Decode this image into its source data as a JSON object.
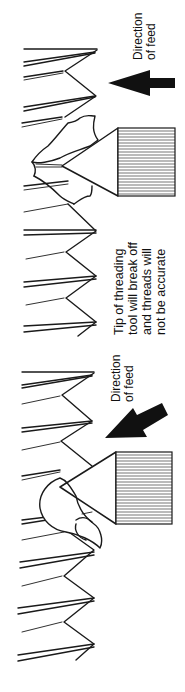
{
  "figure": {
    "orientation": "rotated-90-ccw",
    "panels": [
      {
        "id": "top",
        "description": "Incorrect feed: tool fed straight in",
        "feed_label": [
          "Direction",
          "of feed"
        ],
        "annotation": [
          "Tip of threading",
          "tool will break off",
          "and threads will",
          "not be accurate"
        ],
        "arrow_direction": "straight"
      },
      {
        "id": "bottom",
        "description": "Correct feed: tool fed at an angle, chip curls off",
        "feed_label": [
          "Direction",
          "of feed"
        ],
        "arrow_direction": "angled"
      }
    ]
  },
  "colors": {
    "ink": "#1a1a1a",
    "background": "#ffffff"
  }
}
